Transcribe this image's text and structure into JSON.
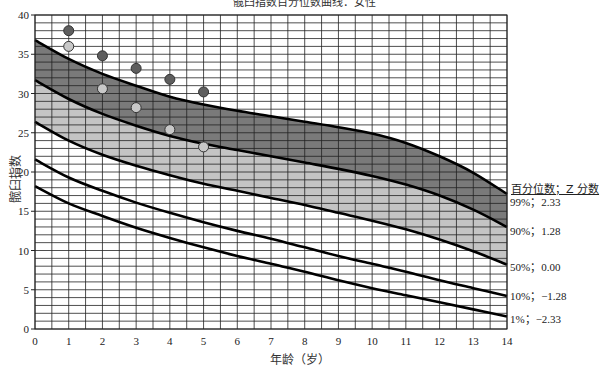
{
  "chart_data": {
    "type": "line",
    "title": "髋臼指数百分位数曲线：女性",
    "xlabel": "年龄（岁）",
    "ylabel": "髋臼指数",
    "xlim": [
      0,
      14
    ],
    "ylim": [
      0,
      40
    ],
    "x_ticks": [
      0,
      1,
      2,
      3,
      4,
      5,
      6,
      7,
      8,
      9,
      10,
      11,
      12,
      13,
      14
    ],
    "y_ticks": [
      0,
      5,
      10,
      15,
      20,
      25,
      30,
      35,
      40
    ],
    "grid": {
      "x_minor_step": 0.5,
      "y_minor_step": 1
    },
    "legend_header": "百分位数；Z 分数",
    "x": [
      0,
      1,
      2,
      3,
      4,
      5,
      6,
      7,
      8,
      9,
      10,
      11,
      12,
      13,
      14
    ],
    "series": [
      {
        "name": "99%；2.33",
        "percentile": "99%",
        "z": "2.33",
        "values": [
          36.8,
          34.4,
          32.5,
          31.0,
          29.6,
          28.6,
          27.8,
          27.1,
          26.4,
          25.7,
          24.9,
          23.7,
          22.0,
          19.9,
          17.2
        ]
      },
      {
        "name": "90%；1.28",
        "percentile": "90%",
        "z": "1.28",
        "values": [
          31.7,
          29.3,
          27.4,
          25.9,
          24.6,
          23.6,
          22.8,
          22.0,
          21.2,
          20.4,
          19.5,
          18.4,
          17.0,
          15.2,
          13.0
        ]
      },
      {
        "name": "50%；0.00",
        "percentile": "50%",
        "z": "0.00",
        "values": [
          26.4,
          24.0,
          22.2,
          20.8,
          19.6,
          18.5,
          17.6,
          16.7,
          15.8,
          14.8,
          13.8,
          12.7,
          11.4,
          9.9,
          8.2
        ]
      },
      {
        "name": "10%；-1.28",
        "percentile": "10%",
        "z": "−1.28",
        "values": [
          21.6,
          19.3,
          17.6,
          16.1,
          14.8,
          13.6,
          12.5,
          11.5,
          10.4,
          9.3,
          8.3,
          7.3,
          6.2,
          5.2,
          4.2
        ]
      },
      {
        "name": "1%；-2.33",
        "percentile": "1%",
        "z": "−2.33",
        "values": [
          18.2,
          16.0,
          14.4,
          12.9,
          11.6,
          10.4,
          9.3,
          8.3,
          7.3,
          6.2,
          5.2,
          4.3,
          3.4,
          2.5,
          1.6
        ]
      }
    ],
    "bands": [
      {
        "between": [
          "99%",
          "90%"
        ],
        "color": "#7a7a7a"
      },
      {
        "between": [
          "90%",
          "50%"
        ],
        "color": "#c4c4c4"
      }
    ],
    "points": [
      {
        "name": "dark markers",
        "color": "#5e5e5e",
        "data": [
          [
            1,
            38.0
          ],
          [
            2,
            34.8
          ],
          [
            3,
            33.2
          ],
          [
            4,
            31.8
          ],
          [
            5,
            30.2
          ]
        ]
      },
      {
        "name": "light markers",
        "color": "#c8c8c8",
        "data": [
          [
            1,
            36.0
          ],
          [
            2,
            30.6
          ],
          [
            3,
            28.2
          ],
          [
            4,
            25.4
          ],
          [
            5,
            23.2
          ]
        ]
      }
    ]
  },
  "labels": {
    "title": "髋臼指数百分位数曲线：女性",
    "xlabel": "年龄（岁）",
    "ylabel": "髋臼指数",
    "legend_header": "百分位数；Z 分数",
    "p99": "99%；2.33",
    "p90": "90%；1.28",
    "p50": "50%；0.00",
    "p10": "10%；−1.28",
    "p1": "1%；−2.33"
  }
}
